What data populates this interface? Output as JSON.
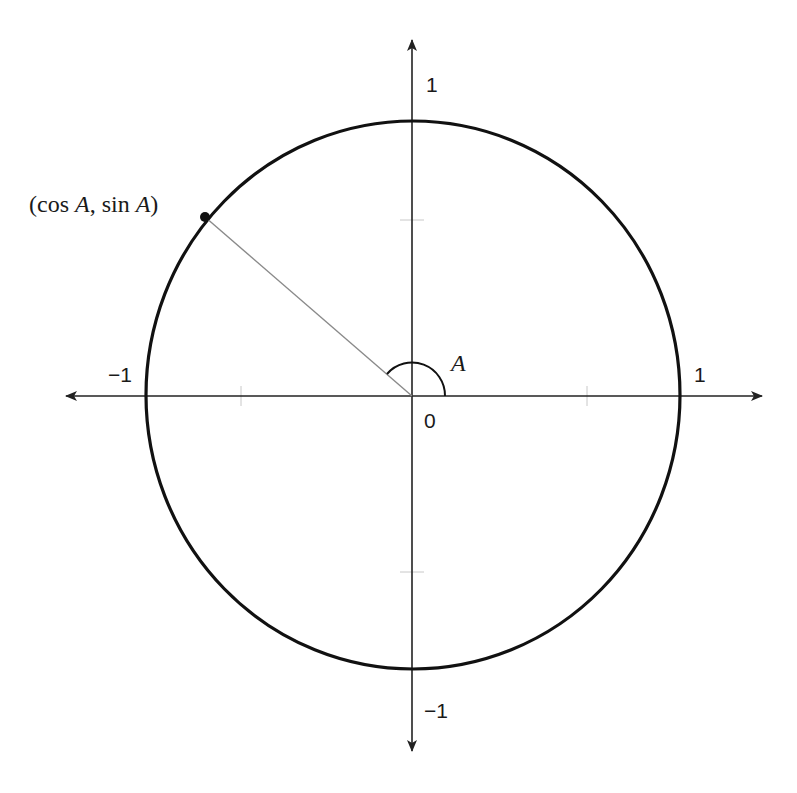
{
  "diagram": {
    "type": "unit-circle",
    "point_label": {
      "open": "(cos ",
      "var1": "A",
      "mid": ", sin ",
      "var2": "A",
      "close": ")"
    },
    "angle_label": "A",
    "origin_label": "0",
    "axis_labels": {
      "x_positive": "1",
      "x_negative": "−1",
      "y_positive": "1",
      "y_negative": "−1"
    },
    "geometry": {
      "origin": [
        412,
        396
      ],
      "radius_x": 267,
      "radius_y": 274,
      "angle_degrees": 139,
      "point": [
        205,
        217
      ],
      "x_axis_range": [
        67,
        761
      ],
      "y_axis_range": [
        40,
        750
      ],
      "half_ticks": true
    },
    "colors": {
      "circle": "#111111",
      "axes": "#222222",
      "radius_line": "#8a8a8a",
      "ticks": "#c8c8c8",
      "text": "#1a1a1a"
    }
  }
}
